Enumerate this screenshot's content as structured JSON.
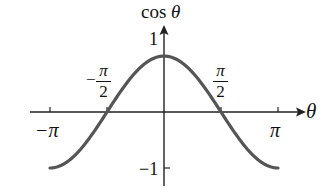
{
  "chart_data": {
    "type": "line",
    "title": "",
    "xlabel": "θ",
    "ylabel": "cos θ",
    "function": "cos θ",
    "xlim": [
      -3.14159,
      3.14159
    ],
    "ylim": [
      -1,
      1
    ],
    "x_tick_labels": [
      "−π",
      "−π/2",
      "π/2",
      "π"
    ],
    "x_ticks": [
      -3.14159,
      -1.5708,
      1.5708,
      3.14159
    ],
    "y_tick_labels": [
      "1",
      "−1"
    ],
    "y_ticks": [
      1,
      -1
    ],
    "grid": false,
    "series": [
      {
        "name": "cos θ",
        "color": "#555555",
        "x": [
          -3.14159,
          -2.35619,
          -1.5708,
          -0.7854,
          0,
          0.7854,
          1.5708,
          2.35619,
          3.14159
        ],
        "values": [
          -1,
          -0.707,
          0,
          0.707,
          1,
          0.707,
          0,
          -0.707,
          -1
        ]
      }
    ]
  },
  "labels": {
    "y_axis": "cos",
    "y_axis_var": "θ",
    "x_axis_var": "θ",
    "y_one": "1",
    "y_neg_one": "−1",
    "neg_pi": "−π",
    "pi": "π",
    "neg_half_sign": "−",
    "half_num": "π",
    "half_den": "2"
  }
}
